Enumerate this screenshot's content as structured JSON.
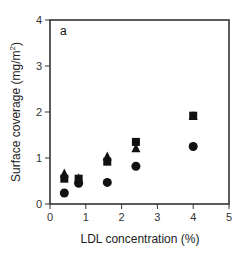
{
  "chart_data": {
    "type": "scatter",
    "title": "",
    "panel_label": "a",
    "xlabel": "LDL concentration (%)",
    "ylabel": "Surface coverage (mg/m²)",
    "ylabel_main": "Surface coverage (mg/m",
    "ylabel_sup": "2",
    "ylabel_end": ")",
    "xlim": [
      0,
      5
    ],
    "ylim": [
      0,
      4
    ],
    "xticks": [
      0,
      1,
      2,
      3,
      4,
      5
    ],
    "yticks": [
      0,
      1,
      2,
      3,
      4
    ],
    "grid": false,
    "legend": null,
    "series": [
      {
        "name": "triangle",
        "marker": "triangle",
        "color": "#111111",
        "x": [
          0.4,
          0.8,
          1.6,
          2.4,
          4.0
        ],
        "y": [
          0.65,
          0.55,
          1.02,
          1.2,
          1.9
        ]
      },
      {
        "name": "square",
        "marker": "square",
        "color": "#111111",
        "x": [
          0.4,
          0.8,
          1.6,
          2.4,
          4.0
        ],
        "y": [
          0.55,
          0.55,
          0.92,
          1.35,
          1.92
        ]
      },
      {
        "name": "circle",
        "marker": "circle",
        "color": "#111111",
        "x": [
          0.4,
          0.8,
          1.6,
          2.4,
          4.0
        ],
        "y": [
          0.24,
          0.45,
          0.47,
          0.82,
          1.25
        ]
      }
    ]
  }
}
